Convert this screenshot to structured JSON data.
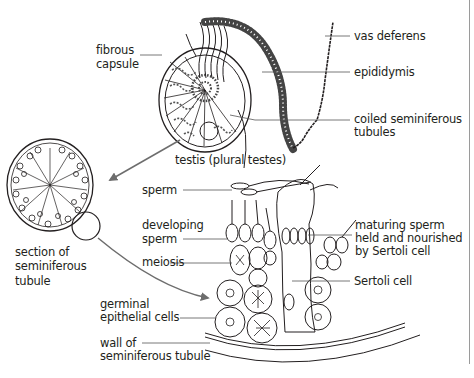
{
  "diagram": {
    "colors": {
      "ink": "#231f20",
      "leader": "#555555",
      "arrow": "#6d6d6d",
      "border": "#9a9a9a"
    },
    "labels": {
      "vas_deferens": "vas deferens",
      "epididymis": "epididymis",
      "fibrous_capsule_1": "fibrous",
      "fibrous_capsule_2": "capsule",
      "coiled_1": "coiled seminiferous",
      "coiled_2": "tubules",
      "testis": "testis (plural testes)",
      "sperm": "sperm",
      "developing_1": "developing",
      "developing_2": "sperm",
      "meiosis": "meiosis",
      "maturing_1": "maturing sperm",
      "maturing_2": "held and nourished",
      "maturing_3": "by Sertoli cell",
      "sertoli": "Sertoli cell",
      "section_1": "section of",
      "section_2": "seminiferous",
      "section_3": "tubule",
      "germinal_1": "germinal",
      "germinal_2": "epithelial cells",
      "wall_1": "wall of",
      "wall_2": "seminiferous tubule"
    }
  }
}
